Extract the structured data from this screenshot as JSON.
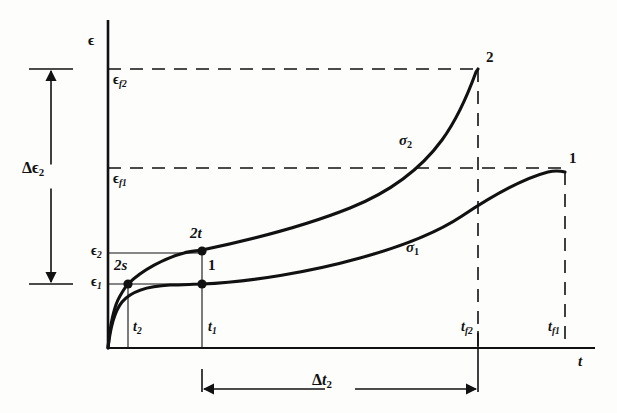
{
  "figure": {
    "type": "creep-strain-time-diagram",
    "background": "#fdfdfc",
    "ink_color": "#111111"
  },
  "axes": {
    "y_label": "ϵ",
    "x_label": "t",
    "origin": {
      "x": 108,
      "y": 348
    },
    "y_top": 20,
    "x_right": 595
  },
  "y_ticks": [
    {
      "id": "eps_f2",
      "label_main": "ϵ",
      "label_sub": "f2",
      "y": 69
    },
    {
      "id": "eps_f1",
      "label_main": "ϵ",
      "label_sub": "f1",
      "y": 168
    },
    {
      "id": "eps_2",
      "label_main": "ϵ",
      "label_sub": "2",
      "y": 253
    },
    {
      "id": "eps_1",
      "label_main": "ϵ",
      "label_sub": "1",
      "y": 284
    }
  ],
  "x_ticks": [
    {
      "id": "t_2",
      "label_main": "t",
      "label_sub": "2",
      "x": 127
    },
    {
      "id": "t_1",
      "label_main": "t",
      "label_sub": "1",
      "x": 202
    },
    {
      "id": "t_f2",
      "label_main": "t",
      "label_sub": "f2",
      "x": 478
    },
    {
      "id": "t_f1",
      "label_main": "t",
      "label_sub": "f1",
      "x": 565
    }
  ],
  "curves": [
    {
      "id": "sigma_1",
      "label_main": "σ",
      "label_sub": "1",
      "label_x": 406,
      "label_y": 240,
      "end_label": "1",
      "end_label_x": 569,
      "end_label_y": 151,
      "path": "M 108 348 C 110 330 114 312 122 302 C 132 290 150 286 170 285 C 182 285 194 284 202 284 C 250 282 310 272 360 258 C 400 247 435 234 462 216 C 492 196 525 178 548 172 C 556 170 561 171 565 172"
    },
    {
      "id": "sigma_2",
      "label_main": "σ",
      "label_sub": "2",
      "label_x": 399,
      "label_y": 133,
      "end_label": "2",
      "end_label_x": 486,
      "end_label_y": 50,
      "path": "M 108 348 C 110 326 114 306 120 296 C 124 289 126 286 128 284 C 142 270 165 258 184 253 C 190 251 197 251 202 250 C 250 240 305 226 350 208 C 390 192 420 170 442 140 C 458 118 468 94 476 72 L 478 69"
    }
  ],
  "points": [
    {
      "id": "2s",
      "label": "2s",
      "x": 128,
      "y": 284,
      "label_x": 114,
      "label_y": 258
    },
    {
      "id": "2t",
      "label": "2t",
      "x": 202,
      "y": 251,
      "label_x": 190,
      "label_y": 226
    },
    {
      "id": "1",
      "label": "1",
      "x": 202,
      "y": 284,
      "label_x": 208,
      "label_y": 258
    }
  ],
  "dashed_lines": {
    "eps_f2_horizontal": {
      "x1": 108,
      "y": 69,
      "x2": 478
    },
    "eps_f1_horizontal": {
      "x1": 108,
      "y": 168,
      "x2": 565
    },
    "t_f2_vertical": {
      "x": 478,
      "y1": 69,
      "y2": 348
    },
    "t_f1_vertical": {
      "x": 565,
      "y1": 172,
      "y2": 348
    }
  },
  "solid_guides": {
    "eps_2_horizontal": {
      "x1": 108,
      "y": 253,
      "x2": 202
    },
    "eps_1_horizontal": {
      "x1": 108,
      "y": 284,
      "x2": 202
    },
    "t_2_vertical": {
      "x": 128,
      "y1": 284,
      "y2": 348
    },
    "t_1_vertical": {
      "x": 202,
      "y1": 251,
      "y2": 348
    }
  },
  "annotations": {
    "delta_eps_2": {
      "label_main": "Δϵ",
      "label_sub": "2",
      "label_x": 22,
      "label_y": 160,
      "arrow_x": 51,
      "arrow_top_y": 69,
      "arrow_bottom_y": 284,
      "cap_half_width": 22
    },
    "delta_t_2": {
      "label_main": "Δt",
      "label_sub": "2",
      "label_x": 312,
      "label_y": 372,
      "arrow_y": 389,
      "arrow_left_x": 202,
      "arrow_right_x": 478,
      "cap_half_height": 20
    }
  }
}
